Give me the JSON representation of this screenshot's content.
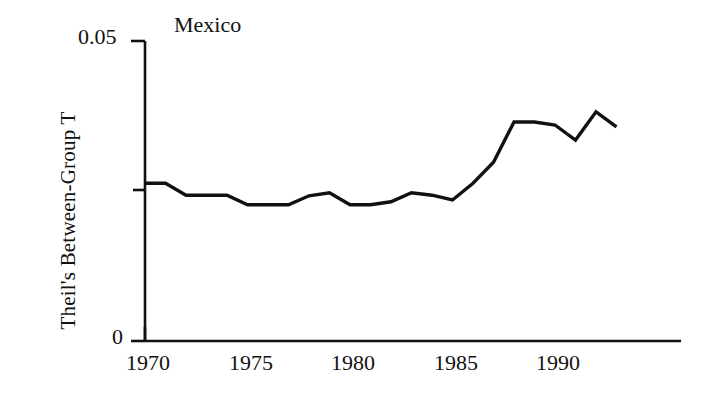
{
  "chart_data": {
    "type": "line",
    "title": "Mexico",
    "xlabel": "",
    "ylabel": "Theil's Between-Group T",
    "xlim": [
      1970,
      1993.5
    ],
    "ylim": [
      0,
      0.05
    ],
    "grid": false,
    "legend": null,
    "x_tick_labels": [
      "1970",
      "1975",
      "1980",
      "1985",
      "1990"
    ],
    "x_ticks": [
      1970,
      1975,
      1980,
      1985,
      1990
    ],
    "y_tick_labels": [
      "0.05",
      "0"
    ],
    "y_ticks": [
      0.05,
      0.025,
      0
    ],
    "y_ticks_labeled": [
      0.05,
      0
    ],
    "series": [
      {
        "name": "Mexico",
        "color": "#111111",
        "x": [
          1970,
          1971,
          1972,
          1973,
          1974,
          1975,
          1976,
          1977,
          1978,
          1979,
          1980,
          1981,
          1982,
          1983,
          1984,
          1985,
          1986,
          1987,
          1988,
          1989,
          1990,
          1991,
          1992,
          1993
        ],
        "values": [
          0.0263,
          0.0263,
          0.0243,
          0.0243,
          0.0243,
          0.0227,
          0.0227,
          0.0227,
          0.0242,
          0.0247,
          0.0227,
          0.0227,
          0.0232,
          0.0247,
          0.0243,
          0.0235,
          0.0263,
          0.0298,
          0.0365,
          0.0365,
          0.036,
          0.0335,
          0.0382,
          0.0357
        ]
      }
    ]
  },
  "axes": {
    "y_top_label": "0.05",
    "y_bottom_label": "0",
    "x_labels": [
      "1970",
      "1975",
      "1980",
      "1985",
      "1990"
    ],
    "axis_color": "#111111",
    "line_color": "#111111"
  },
  "title": "Mexico",
  "ylabel": "Theil's Between-Group T"
}
